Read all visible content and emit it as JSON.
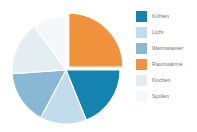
{
  "chart_data": {
    "type": "pie",
    "title": "",
    "subtitle": "",
    "xlabel": "",
    "ylabel": "",
    "legend_position": "right",
    "grid": false,
    "exploded_slice": "Raumwärme",
    "categories": [
      "Kühlen",
      "Licht",
      "Warmwasser",
      "Raumwärme",
      "Kochen",
      "Spülen"
    ],
    "values": [
      19,
      14,
      16,
      25,
      16,
      10
    ],
    "colors": [
      "#1383b0",
      "#c2dced",
      "#8ab8d4",
      "#f0913c",
      "#e4eef2",
      "#f4f8fa"
    ],
    "slices": [
      {
        "label": "Kühlen",
        "value": 19,
        "color": "#1383b0",
        "start_angle": 90,
        "end_angle": 158,
        "exploded": false
      },
      {
        "label": "Licht",
        "value": 14,
        "color": "#c2dced",
        "start_angle": 158,
        "end_angle": 208,
        "exploded": false
      },
      {
        "label": "Warmwasser",
        "value": 16,
        "color": "#8ab8d4",
        "start_angle": 208,
        "end_angle": 266,
        "exploded": false
      },
      {
        "label": "Raumwärme",
        "value": 25,
        "color": "#f0913c",
        "start_angle": 0,
        "end_angle": 90,
        "exploded": true
      },
      {
        "label": "Kochen",
        "value": 16,
        "color": "#e4eef2",
        "start_angle": 266,
        "end_angle": 324,
        "exploded": false
      },
      {
        "label": "Spülen",
        "value": 10,
        "color": "#f4f8fa",
        "start_angle": 324,
        "end_angle": 360,
        "exploded": false
      }
    ]
  },
  "legend": {
    "items": [
      {
        "label": "Kühlen",
        "color": "#1383b0"
      },
      {
        "label": "Licht",
        "color": "#c2dced"
      },
      {
        "label": "Warmwasser",
        "color": "#8ab8d4"
      },
      {
        "label": "Raumwärme",
        "color": "#f0913c"
      },
      {
        "label": "Kochen",
        "color": "#e4eef2"
      },
      {
        "label": "Spülen",
        "color": "#f4f8fa"
      }
    ]
  }
}
